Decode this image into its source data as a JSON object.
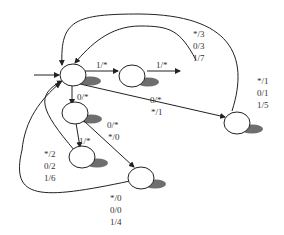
{
  "diagram": {
    "type": "state-machine",
    "colors": {
      "stroke": "#222222",
      "shadow": "#555555",
      "text": "#333333",
      "background": "#ffffff"
    },
    "nodes": [
      {
        "id": "s0",
        "initial": true
      },
      {
        "id": "s1"
      },
      {
        "id": "s2"
      },
      {
        "id": "s3"
      },
      {
        "id": "s4"
      },
      {
        "id": "s5"
      }
    ],
    "edges": [
      {
        "from": "start",
        "to": "s0",
        "label": ""
      },
      {
        "from": "s0",
        "to": "s1",
        "label": "1/*"
      },
      {
        "from": "s1",
        "to": "s1_next",
        "label": "1/*"
      },
      {
        "from": "s0",
        "to": "s3",
        "label": "0/*"
      },
      {
        "from": "s0",
        "to": "s2",
        "label_lines": [
          "0/*",
          "*/1"
        ]
      },
      {
        "from": "s3",
        "to": "s4",
        "label": "1/*"
      },
      {
        "from": "s3",
        "to": "s5",
        "label_lines": [
          "0/*",
          "*/0"
        ]
      },
      {
        "from": "s1",
        "to": "s0",
        "label_lines": [
          "*/3",
          "0/3",
          "1/7"
        ]
      },
      {
        "from": "s2",
        "to": "s0",
        "label_lines": [
          "*/1",
          "0/1",
          "1/5"
        ]
      },
      {
        "from": "s4",
        "to": "s0",
        "label_lines": [
          "*/2",
          "0/2",
          "1/6"
        ]
      },
      {
        "from": "s5",
        "to": "s0",
        "label_lines": [
          "*/0",
          "0/0",
          "1/4"
        ]
      }
    ],
    "labels": {
      "e_s0_s1": "1/*",
      "e_s1_out": "1/*",
      "e_s0_s3": "0/*",
      "e_s0_s2_a": "0/*",
      "e_s0_s2_b": "*/1",
      "e_s3_s4": "1/*",
      "e_s3_s5_a": "0/*",
      "e_s3_s5_b": "*/0",
      "e_s1_back": [
        "*/3",
        "0/3",
        "1/7"
      ],
      "e_s2_back": [
        "*/1",
        "0/1",
        "1/5"
      ],
      "e_s4_back": [
        "*/2",
        "0/2",
        "1/6"
      ],
      "e_s5_back": [
        "*/0",
        "0/0",
        "1/4"
      ]
    }
  }
}
